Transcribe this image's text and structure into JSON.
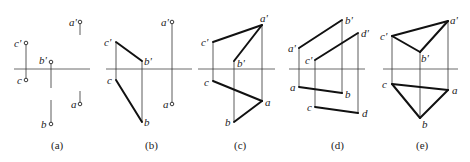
{
  "panels": [
    {
      "id": "a",
      "caption": "(a)",
      "axis": {
        "x1": 14,
        "x2": 90,
        "y": 69
      },
      "points": [
        {
          "name": "c'",
          "x": 26,
          "y": 43,
          "dot": true
        },
        {
          "name": "c",
          "x": 26,
          "y": 80,
          "dot": true
        },
        {
          "name": "b'",
          "x": 51,
          "y": 62,
          "dot": true
        },
        {
          "name": "b",
          "x": 51,
          "y": 124,
          "dot": true
        },
        {
          "name": "a'",
          "x": 80,
          "y": 22,
          "dot": true
        },
        {
          "name": "a",
          "x": 80,
          "y": 104,
          "dot": true
        }
      ]
    },
    {
      "id": "b",
      "caption": "(b)",
      "axis": {
        "x1": 106,
        "x2": 192,
        "y": 69
      },
      "points": [
        {
          "name": "c'",
          "x": 116,
          "y": 42
        },
        {
          "name": "b'",
          "x": 142,
          "y": 61
        },
        {
          "name": "c",
          "x": 116,
          "y": 80
        },
        {
          "name": "b",
          "x": 142,
          "y": 122
        },
        {
          "name": "a'",
          "x": 172,
          "y": 22,
          "dot": true
        },
        {
          "name": "a",
          "x": 172,
          "y": 104,
          "dot": true
        }
      ],
      "edges": [
        [
          "c'",
          "b'"
        ],
        [
          "c",
          "b"
        ]
      ]
    },
    {
      "id": "c",
      "caption": "(c)",
      "axis": {
        "x1": 198,
        "x2": 275,
        "y": 69
      },
      "points": [
        {
          "name": "a'",
          "x": 262,
          "y": 25
        },
        {
          "name": "c'",
          "x": 213,
          "y": 42
        },
        {
          "name": "b'",
          "x": 234,
          "y": 61
        },
        {
          "name": "c",
          "x": 213,
          "y": 81
        },
        {
          "name": "a",
          "x": 262,
          "y": 101
        },
        {
          "name": "b",
          "x": 234,
          "y": 122
        }
      ],
      "edges": [
        [
          "c'",
          "a'"
        ],
        [
          "b'",
          "a'"
        ],
        [
          "c",
          "a"
        ],
        [
          "b",
          "a"
        ]
      ]
    },
    {
      "id": "d",
      "caption": "(d)",
      "axis": {
        "x1": 289,
        "x2": 365,
        "y": 69
      },
      "points": [
        {
          "name": "a'",
          "x": 299,
          "y": 48
        },
        {
          "name": "b'",
          "x": 342,
          "y": 20
        },
        {
          "name": "c'",
          "x": 315,
          "y": 60
        },
        {
          "name": "d'",
          "x": 358,
          "y": 33
        },
        {
          "name": "a",
          "x": 299,
          "y": 87
        },
        {
          "name": "b",
          "x": 342,
          "y": 93
        },
        {
          "name": "c",
          "x": 315,
          "y": 107
        },
        {
          "name": "d",
          "x": 358,
          "y": 113
        }
      ],
      "edges": [
        [
          "a'",
          "b'"
        ],
        [
          "c'",
          "d'"
        ],
        [
          "a",
          "b"
        ],
        [
          "c",
          "d"
        ]
      ]
    },
    {
      "id": "e",
      "caption": "(e)",
      "axis": {
        "x1": 383,
        "x2": 458,
        "y": 69
      },
      "points": [
        {
          "name": "a'",
          "x": 448,
          "y": 21
        },
        {
          "name": "c'",
          "x": 392,
          "y": 36
        },
        {
          "name": "b'",
          "x": 420,
          "y": 52
        },
        {
          "name": "c",
          "x": 392,
          "y": 84
        },
        {
          "name": "a",
          "x": 448,
          "y": 90
        },
        {
          "name": "b",
          "x": 420,
          "y": 118
        }
      ],
      "edges": [
        [
          "c'",
          "a'"
        ],
        [
          "c'",
          "b'"
        ],
        [
          "b'",
          "a'"
        ],
        [
          "c",
          "a"
        ],
        [
          "c",
          "b"
        ],
        [
          "b",
          "a"
        ]
      ]
    }
  ],
  "captions": {
    "a": "(a)",
    "b": "(b)",
    "c": "(c)",
    "d": "(d)",
    "e": "(e)"
  }
}
